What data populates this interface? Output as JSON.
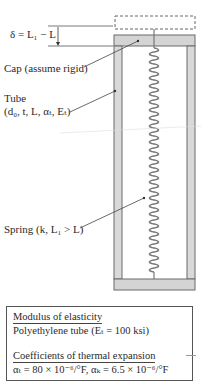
{
  "figure": {
    "delta_label": "δ = L₁ − L",
    "cap_label": "Cap (assume rigid)",
    "tube_label_line1": "Tube",
    "tube_label_line2": "(d₀, t, L, αₜ, Eₜ)",
    "spring_label": "Spring (k, L₁ > L)",
    "colors": {
      "tube_fill": "#d4d4d4",
      "tube_stroke": "#6a6a6a",
      "spring": "#7a7a7a",
      "dashed_box": "#666666"
    }
  },
  "properties_box": {
    "modulus_heading": "Modulus of elasticity",
    "modulus_value": "Polyethylene tube (Eₜ = 100 ksi)",
    "thermal_heading": "Coefficients of thermal expansion",
    "thermal_value": "αₜ = 80 × 10⁻⁶/°F, αₖ = 6.5 × 10⁻⁶/°F"
  }
}
